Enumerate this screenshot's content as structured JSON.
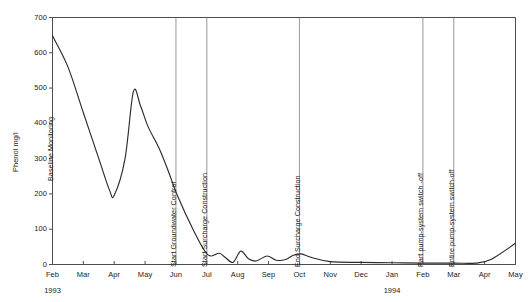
{
  "chart_data": {
    "type": "line",
    "title": "",
    "subtitle": "",
    "xlabel": "",
    "ylabel": "Phenol mg/l",
    "ylim": [
      0,
      700
    ],
    "yticks": [
      0,
      100,
      200,
      300,
      400,
      500,
      600,
      700
    ],
    "ytick_labels": [
      "0",
      "100",
      "200",
      "300",
      "400",
      "500",
      "600",
      "700"
    ],
    "xlim": [
      "Feb 1993",
      "May 1994"
    ],
    "xticks": [
      "Feb",
      "Mar",
      "Apr",
      "May",
      "Jun",
      "Jul",
      "Aug",
      "Sep",
      "Oct",
      "Nov",
      "Dec",
      "Jan",
      "Feb",
      "Mar",
      "Apr",
      "May"
    ],
    "x_group_labels": [
      {
        "text": "1993",
        "at_tick": "Feb",
        "index": 0
      },
      {
        "text": "1994",
        "at_tick": "Jan",
        "index": 11
      }
    ],
    "grid": false,
    "legend": null,
    "line_color": "#2b2b2b",
    "axis_color": "#4d4d4d",
    "annotation_line_color": "#8c8c8c",
    "series": [
      {
        "name": "Phenol concentration",
        "units": "mg/l",
        "x": [
          "Feb",
          "Feb-mid",
          "Mar",
          "Mar-mid",
          "Mar-late",
          "Apr-early",
          "Apr",
          "Apr-mid",
          "May-early",
          "May",
          "May-late",
          "Jun",
          "Jun-mid",
          "Jul-early",
          "Jul",
          "Jul-mid",
          "Jul-late",
          "Aug-early",
          "Aug",
          "Aug-mid",
          "Aug-late",
          "Sep-early",
          "Sep",
          "Sep-mid",
          "Sep-late",
          "Oct-early",
          "Oct",
          "Oct-mid",
          "Nov",
          "Dec",
          "Jan",
          "Feb",
          "Mar",
          "Apr",
          "Apr-late",
          "May"
        ],
        "values": [
          648,
          560,
          430,
          300,
          210,
          196,
          300,
          490,
          450,
          390,
          330,
          265,
          195,
          100,
          36,
          24,
          32,
          20,
          6,
          38,
          16,
          10,
          24,
          12,
          14,
          26,
          30,
          20,
          8,
          6,
          5,
          4,
          4,
          4,
          14,
          60
        ]
      }
    ],
    "annotations": [
      {
        "text": "Baseline Monitoring",
        "type": "text-label",
        "at": "Feb-1993"
      },
      {
        "text": "Start Groundwater Control",
        "type": "vertical-line",
        "at": "Jun-1993"
      },
      {
        "text": "Start Surcharge Construction",
        "type": "vertical-line",
        "at": "Jul-1993"
      },
      {
        "text": "End Surcharge Construction",
        "type": "vertical-line",
        "at": "Oct-1993"
      },
      {
        "text": "Part pump-system switch -off",
        "type": "vertical-line",
        "at": "Feb-1994"
      },
      {
        "text": "Entire pump-system switch-off",
        "type": "vertical-line",
        "at": "Mar-1994"
      }
    ]
  }
}
